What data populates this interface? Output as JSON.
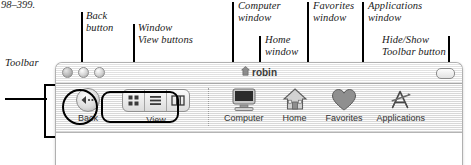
{
  "figure": {
    "page_reference": "98–399."
  },
  "callouts": [
    {
      "name": "toolbar",
      "text": "Toolbar"
    },
    {
      "name": "back-button",
      "text": "Back\nbutton"
    },
    {
      "name": "window-view-buttons",
      "text": "Window\nView buttons"
    },
    {
      "name": "computer-window",
      "text": "Computer\nwindow"
    },
    {
      "name": "home-window",
      "text": "Home\nwindow"
    },
    {
      "name": "favorites-window",
      "text": "Favorites\nwindow"
    },
    {
      "name": "applications-window",
      "text": "Applications\nwindow"
    },
    {
      "name": "hide-show-toolbar",
      "text": "Hide/Show\nToolbar button"
    }
  ],
  "window": {
    "title": "robin",
    "title_icon": "home-icon",
    "controls": [
      {
        "name": "close-button",
        "label": "Close"
      },
      {
        "name": "minimize-button",
        "label": "Minimize"
      },
      {
        "name": "zoom-button",
        "label": "Zoom"
      }
    ],
    "hide_show_toolbar_button": {
      "name": "hide-show-toolbar-button",
      "label": ""
    }
  },
  "toolbar": {
    "back": {
      "label": "Back",
      "icon": "back-arrow-icon"
    },
    "view": {
      "label": "View",
      "segments": [
        {
          "name": "icon-view",
          "icon": "icon-view-icon",
          "selected": false
        },
        {
          "name": "list-view",
          "icon": "list-view-icon",
          "selected": false
        },
        {
          "name": "column-view",
          "icon": "column-view-icon",
          "selected": false
        }
      ]
    },
    "places": [
      {
        "name": "computer",
        "label": "Computer",
        "icon": "computer-icon"
      },
      {
        "name": "home",
        "label": "Home",
        "icon": "home-icon"
      },
      {
        "name": "favorites",
        "label": "Favorites",
        "icon": "heart-icon"
      },
      {
        "name": "applications",
        "label": "Applications",
        "icon": "applications-a-icon"
      }
    ]
  }
}
